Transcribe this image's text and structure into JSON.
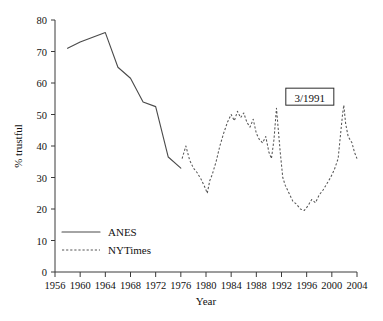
{
  "chart_data": {
    "type": "line",
    "title": "",
    "xlabel": "Year",
    "ylabel": "% trustful",
    "xlim": [
      1956,
      2004
    ],
    "ylim": [
      0,
      80
    ],
    "grid": false,
    "legend_position": "inside lower-left",
    "xticks": [
      1956,
      1960,
      1964,
      1968,
      1972,
      1976,
      1980,
      1984,
      1988,
      1992,
      1996,
      2000,
      2004
    ],
    "xtick_labels": [
      "1956",
      "1960",
      "1964",
      "1968",
      "1972",
      "1976",
      "1980",
      "1984",
      "1988",
      "1992",
      "1996",
      "2000",
      "2004"
    ],
    "yticks": [
      0,
      10,
      20,
      30,
      40,
      50,
      60,
      70,
      80
    ],
    "ytick_labels": [
      "0",
      "10",
      "20",
      "30",
      "40",
      "50",
      "60",
      "70",
      "80"
    ],
    "annotations": [
      {
        "text": "3/1991",
        "x": 1996.5,
        "y": 55.5,
        "boxed": true
      }
    ],
    "series": [
      {
        "name": "ANES",
        "style": "solid",
        "x": [
          1958,
          1960,
          1962,
          1964,
          1966,
          1968,
          1970,
          1972,
          1974,
          1976
        ],
        "values": [
          71,
          73,
          74.5,
          76,
          65,
          61.5,
          54,
          52.5,
          36.5,
          33
        ]
      },
      {
        "name": "NYTimes",
        "style": "dashed",
        "x": [
          1976.2,
          1976.8,
          1977.4,
          1978.0,
          1978.6,
          1979.2,
          1979.8,
          1980.2,
          1980.6,
          1981.0,
          1981.6,
          1982.2,
          1982.8,
          1983.4,
          1984.0,
          1984.5,
          1985.0,
          1985.5,
          1986.0,
          1986.5,
          1987.0,
          1987.5,
          1988.0,
          1988.5,
          1989.0,
          1989.5,
          1990.0,
          1990.4,
          1990.8,
          1991.2,
          1991.5,
          1991.8,
          1992.2,
          1992.6,
          1993.2,
          1993.8,
          1994.4,
          1995.0,
          1995.6,
          1996.2,
          1996.8,
          1997.4,
          1998.0,
          1998.6,
          1999.2,
          1999.8,
          2000.4,
          2001.0,
          2001.4,
          2001.7,
          2001.9,
          2002.2,
          2002.6,
          2003.2,
          2003.6,
          2004.0
        ],
        "values": [
          36,
          40,
          35.5,
          33,
          31.5,
          29.5,
          27,
          25,
          29,
          31,
          35,
          40,
          44,
          47.5,
          50,
          48,
          51,
          49,
          50.5,
          47.5,
          46,
          48.5,
          44,
          42,
          41,
          43,
          38,
          36,
          42,
          52,
          45,
          38,
          30,
          27.5,
          25,
          22.5,
          21.5,
          20,
          19.5,
          21,
          23,
          22,
          24.5,
          26,
          28,
          30,
          32.5,
          36,
          44,
          50,
          53,
          47,
          43,
          41,
          38,
          36
        ]
      }
    ]
  },
  "axis": {
    "ylabel": "% trustful",
    "xlabel": "Year"
  },
  "legend": {
    "items": [
      {
        "label": "ANES",
        "style": "solid"
      },
      {
        "label": "NYTimes",
        "style": "dashed"
      }
    ]
  }
}
